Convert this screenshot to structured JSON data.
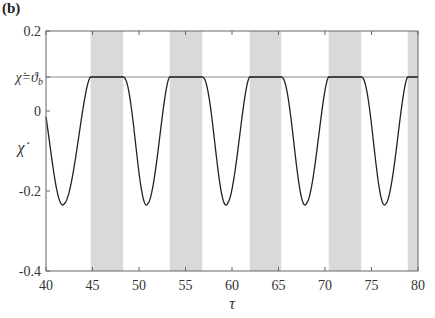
{
  "panel_label": "(b)",
  "colors": {
    "band": "#d9d9d9",
    "curve": "#222222",
    "frame": "#666666",
    "refline": "#888888"
  },
  "chart_data": {
    "type": "line",
    "title": "",
    "xlabel": "τ",
    "ylabel": "χ̇",
    "xlim": [
      40,
      80
    ],
    "ylim": [
      -0.4,
      0.2
    ],
    "grid": false,
    "legend": null,
    "x_ticks": [
      40,
      45,
      50,
      55,
      60,
      65,
      70,
      75,
      80
    ],
    "y_ticks": [
      {
        "value": 0.2,
        "label": "0.2"
      },
      {
        "value": 0.085,
        "label": "χ̇=ϑb"
      },
      {
        "value": 0.0,
        "label": "0"
      },
      {
        "value": -0.2,
        "label": "-0.2"
      },
      {
        "value": -0.4,
        "label": "-0.4"
      }
    ],
    "reference_line": {
      "y": 0.085,
      "label": "χ̇=ϑb"
    },
    "shaded_bands": [
      [
        44.8,
        48.3
      ],
      [
        53.3,
        56.8
      ],
      [
        61.9,
        65.3
      ],
      [
        70.4,
        73.9
      ],
      [
        78.9,
        80.0
      ]
    ],
    "series": [
      {
        "name": "chi_dot",
        "description": "Periodic signal: flat plateau at χ̇=ϑb (≈0.085) during shaded intervals, dipping to a minimum ≈ -0.235 between them",
        "plateau_value": 0.085,
        "minima": [
          {
            "x": 43.0,
            "y": -0.235
          },
          {
            "x": 51.6,
            "y": -0.235
          },
          {
            "x": 60.1,
            "y": -0.235
          },
          {
            "x": 68.6,
            "y": -0.235
          },
          {
            "x": 77.1,
            "y": -0.235
          }
        ],
        "period": 8.53
      }
    ]
  }
}
